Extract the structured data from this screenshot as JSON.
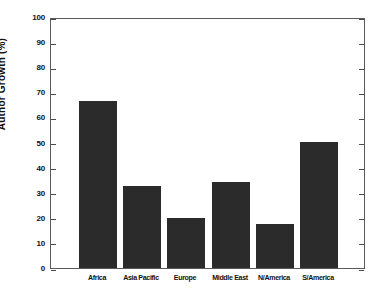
{
  "chart_data": {
    "type": "bar",
    "title": "",
    "xlabel": "",
    "ylabel": "Author Growth (%)",
    "categories": [
      "Africa",
      "Asia Pacific",
      "Europe",
      "Middle East",
      "N/America",
      "S/America"
    ],
    "values": [
      66.5,
      32.7,
      20.0,
      34.3,
      17.5,
      50.2
    ],
    "ylim": [
      0,
      100
    ],
    "ytick_labels": [
      "0",
      "10",
      "20",
      "30",
      "40",
      "50",
      "60",
      "70",
      "80",
      "90",
      "100"
    ],
    "ytick_values": [
      0,
      10,
      20,
      30,
      40,
      50,
      60,
      70,
      80,
      90,
      100
    ],
    "grid": false,
    "legend": null,
    "bar_color": "#2b2b2b",
    "axis_color": "#5a5a5a",
    "background_color": "#ffffff"
  }
}
